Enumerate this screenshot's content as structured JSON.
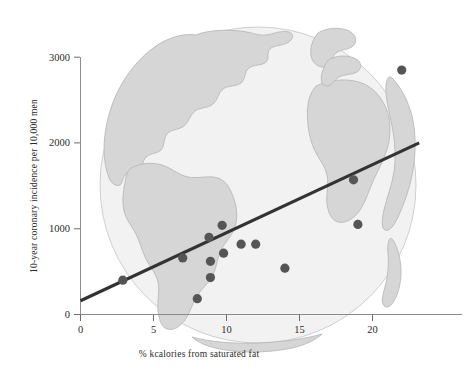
{
  "figure": {
    "background_color": "#ffffff",
    "point_color": "#555555",
    "line_color": "#333333",
    "globe_ocean_color": "#f2f2f2",
    "globe_land_color": "#d6d6d6",
    "axis_color": "#8c8c8c"
  },
  "chart_data": {
    "type": "scatter",
    "title": "",
    "xlabel": "% kcalories from saturated fat",
    "ylabel": "10-year coronary incidence per 10,000 men",
    "xlim": [
      0,
      23.5
    ],
    "ylim": [
      0,
      3150
    ],
    "xticks": [
      0,
      5,
      10,
      15,
      20
    ],
    "xtick_labels": [
      "0",
      "5",
      "10",
      "15",
      "20"
    ],
    "yticks": [
      0,
      1000,
      2000,
      3000
    ],
    "ytick_labels": [
      "0",
      "1000",
      "2000",
      "3000"
    ],
    "grid": false,
    "legend": null,
    "points": [
      {
        "x": 2.9,
        "y": 400
      },
      {
        "x": 7.0,
        "y": 660
      },
      {
        "x": 8.0,
        "y": 185
      },
      {
        "x": 8.8,
        "y": 900
      },
      {
        "x": 8.9,
        "y": 620
      },
      {
        "x": 8.9,
        "y": 430
      },
      {
        "x": 9.7,
        "y": 1040
      },
      {
        "x": 9.8,
        "y": 715
      },
      {
        "x": 11.0,
        "y": 820
      },
      {
        "x": 12.0,
        "y": 820
      },
      {
        "x": 14.0,
        "y": 540
      },
      {
        "x": 18.7,
        "y": 1570
      },
      {
        "x": 19.0,
        "y": 1050
      },
      {
        "x": 22.0,
        "y": 2850
      }
    ],
    "trendline": {
      "label": "",
      "x_start": 0,
      "y_start": 160,
      "x_end": 23.2,
      "y_end": 2000
    },
    "annotations": [
      {
        "name": "globe-watermark",
        "text": ""
      }
    ]
  }
}
